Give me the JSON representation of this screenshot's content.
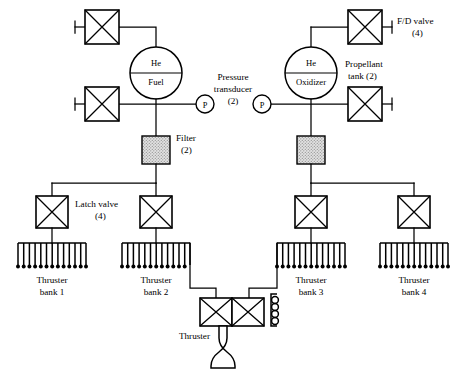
{
  "diagram": {
    "colors": {
      "line": "#000000",
      "background": "#ffffff",
      "filter_fill": "#d8d8d8"
    },
    "tanks": [
      {
        "id": "fuel-tank",
        "pressurant_label": "He",
        "propellant_label": "Fuel"
      },
      {
        "id": "oxidizer-tank",
        "pressurant_label": "He",
        "propellant_label": "Oxidizer"
      }
    ],
    "pressure_transducers": {
      "symbol": "P",
      "label_line1": "Pressure",
      "label_line2": "transducer",
      "label_count": "(2)",
      "count": 2
    },
    "propellant_tank_label": {
      "line1": "Propellant",
      "line2": "tank (2)"
    },
    "fd_valve_label": {
      "line1": "F/D valve",
      "line2": "(4)"
    },
    "filter_label": {
      "line1": "Filter",
      "line2": "(2)"
    },
    "latch_valve_label": {
      "line1": "Latch valve",
      "line2": "(4)"
    },
    "thruster_label": "Thruster",
    "thruster_banks": [
      {
        "line1": "Thruster",
        "line2": "bank 1",
        "teeth": 13
      },
      {
        "line1": "Thruster",
        "line2": "bank 2",
        "teeth": 13
      },
      {
        "line1": "Thruster",
        "line2": "bank 3",
        "teeth": 13
      },
      {
        "line1": "Thruster",
        "line2": "bank 4",
        "teeth": 13
      }
    ],
    "icons": {
      "valve": "x-box-valve-icon",
      "tank": "spherical-tank-icon",
      "transducer": "pressure-transducer-icon",
      "filter": "filter-icon",
      "nozzle": "rocket-nozzle-icon",
      "coil": "heater-coil-icon"
    }
  }
}
